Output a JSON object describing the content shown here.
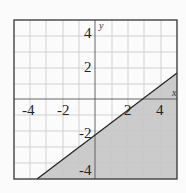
{
  "graph": {
    "type": "linear-inequality",
    "boundary_line": "y = (2/3)x - 2",
    "boundary_style": "solid",
    "shaded_region": "below-right of line",
    "x_range": [
      -5,
      5
    ],
    "y_range": [
      -5,
      5
    ],
    "axis_labels": {
      "x": "x",
      "y": "y"
    },
    "x_tick_labels": [
      "-4",
      "-2",
      "2",
      "4"
    ],
    "y_tick_labels": [
      "4",
      "2",
      "-2",
      "-4"
    ],
    "colors": {
      "shade": "#c9c9c9",
      "grid": "#c4c4c4",
      "line": "#222222",
      "frame": "#333333"
    }
  }
}
